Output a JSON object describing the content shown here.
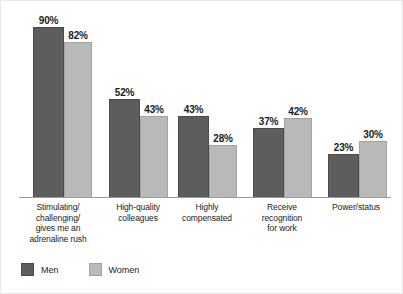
{
  "chart_data": {
    "type": "bar",
    "title": "",
    "subtitle": "",
    "xlabel": "",
    "ylabel": "",
    "ylim": [
      0,
      100
    ],
    "grid": false,
    "legend_position": "bottom-left",
    "value_suffix": "%",
    "categories": [
      "Stimulating/ challenging/ gives me an adrenaline rush",
      "High-quality colleagues",
      "Highly compensated",
      "Receive recognition for work",
      "Power/status"
    ],
    "category_lines": [
      [
        "Stimulating/",
        "challenging/",
        "gives me an",
        "adrenaline rush"
      ],
      [
        "High-quality",
        "colleagues"
      ],
      [
        "Highly",
        "compensated"
      ],
      [
        "Receive",
        "recognition",
        "for work"
      ],
      [
        "Power/status"
      ]
    ],
    "series": [
      {
        "name": "Men",
        "color": "#5d5d5d",
        "values": [
          90,
          52,
          43,
          37,
          23
        ],
        "labels": [
          "90%",
          "52%",
          "43%",
          "37%",
          "23%"
        ]
      },
      {
        "name": "Women",
        "color": "#b9b9b9",
        "values": [
          82,
          43,
          28,
          42,
          30
        ],
        "labels": [
          "82%",
          "43%",
          "28%",
          "42%",
          "30%"
        ]
      }
    ]
  },
  "legend": {
    "items": [
      {
        "label": "Men",
        "color": "#5d5d5d"
      },
      {
        "label": "Women",
        "color": "#b9b9b9"
      }
    ]
  },
  "axis": {
    "baseline_color": "#9a9a9a"
  }
}
